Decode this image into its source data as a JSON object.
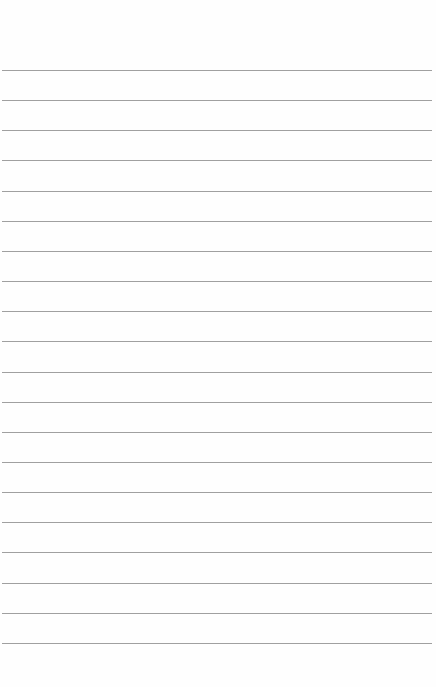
{
  "paper": {
    "type": "lined-paper",
    "background_color": "#fefefe",
    "line_color": "#8f8f8f",
    "line_count": 20,
    "first_line_y": 70,
    "line_spacing": 30.15
  }
}
